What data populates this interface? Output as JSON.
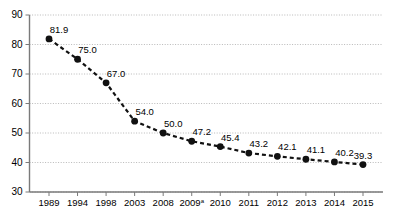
{
  "chart_data": {
    "type": "line",
    "title": "",
    "subtitle": "",
    "xlabel": "",
    "ylabel": "",
    "categories": [
      "1989",
      "1994",
      "1998",
      "2003",
      "2008",
      "2009",
      "2010",
      "2011",
      "2012",
      "2013",
      "2014",
      "2015"
    ],
    "category_superscripts": [
      "",
      "",
      "",
      "",
      "",
      "a",
      "",
      "",
      "",
      "",
      "",
      ""
    ],
    "values": [
      81.9,
      75.0,
      67.0,
      54.0,
      50.0,
      47.2,
      45.4,
      43.2,
      42.1,
      41.1,
      40.2,
      39.3
    ],
    "data_labels": [
      "81.9",
      "75.0",
      "67.0",
      "54.0",
      "50.0",
      "47.2",
      "45.4",
      "43.2",
      "42.1",
      "41.1",
      "40.2",
      "39.3"
    ],
    "ylim": [
      30,
      90
    ],
    "yticks": [
      30,
      40,
      50,
      60,
      70,
      80,
      90
    ],
    "ytick_labels": [
      "30",
      "40",
      "50",
      "60",
      "70",
      "80",
      "90"
    ],
    "grid": true,
    "grid_axis": "y",
    "legend": false,
    "legend_position": "none",
    "marker": "filled-circle",
    "line_style": "dashed",
    "series_color": "#111111",
    "gridline_color": "#9b9b9b",
    "axis_color": "#7a7a7a",
    "background_color": "#ffffff"
  }
}
